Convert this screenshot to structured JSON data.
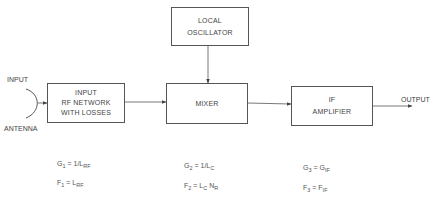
{
  "diagram": {
    "type": "block-diagram",
    "blocks": {
      "input_rf": {
        "lines": [
          "INPUT",
          "RF NETWORK",
          "WITH LOSSES"
        ]
      },
      "local_oscillator": {
        "lines": [
          "LOCAL",
          "OSCILLATOR"
        ]
      },
      "mixer": {
        "lines": [
          "MIXER"
        ]
      },
      "if_amplifier": {
        "lines": [
          "IF",
          "AMPLIFIER"
        ]
      }
    },
    "labels": {
      "input": "INPUT",
      "antenna": "ANTENNA",
      "output": "OUTPUT"
    },
    "equations": {
      "stage1": {
        "gain": {
          "lhs": "G",
          "lhs_sub": "1",
          "rhs": "= 1/L",
          "rhs_sub": "RF"
        },
        "noise": {
          "lhs": "F",
          "lhs_sub": "1",
          "rhs": "= L",
          "rhs_sub": "RF"
        }
      },
      "stage2": {
        "gain": {
          "lhs": "G",
          "lhs_sub": "2",
          "rhs": "= 1/L",
          "rhs_sub": "C"
        },
        "noise": {
          "lhs": "F",
          "lhs_sub": "2",
          "rhs": "= L",
          "rhs_sub": "C",
          "rhs2": " N",
          "rhs2_sub": "R"
        }
      },
      "stage3": {
        "gain": {
          "lhs": "G",
          "lhs_sub": "3",
          "rhs": "= G",
          "rhs_sub": "IF"
        },
        "noise": {
          "lhs": "F",
          "lhs_sub": "3",
          "rhs": "= F",
          "rhs_sub": "IF"
        }
      }
    },
    "connections": [
      {
        "from": "antenna",
        "to": "input_rf"
      },
      {
        "from": "input_rf",
        "to": "mixer"
      },
      {
        "from": "local_oscillator",
        "to": "mixer"
      },
      {
        "from": "mixer",
        "to": "if_amplifier"
      },
      {
        "from": "if_amplifier",
        "to": "output"
      }
    ],
    "colors": {
      "line": "#555555",
      "text": "#444444",
      "background": "#ffffff"
    }
  }
}
